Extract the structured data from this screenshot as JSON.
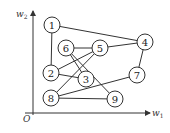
{
  "diagram": {
    "type": "graph",
    "axes": {
      "x_label": "w",
      "x_sub": "1",
      "y_label": "w",
      "y_sub": "2",
      "origin_label": "O"
    },
    "nodes": [
      {
        "id": "1",
        "label": "1",
        "x": 52,
        "y": 25
      },
      {
        "id": "2",
        "label": "2",
        "x": 51,
        "y": 73
      },
      {
        "id": "3",
        "label": "3",
        "x": 86,
        "y": 79
      },
      {
        "id": "4",
        "label": "4",
        "x": 145,
        "y": 42
      },
      {
        "id": "5",
        "label": "5",
        "x": 100,
        "y": 48
      },
      {
        "id": "6",
        "label": "6",
        "x": 66,
        "y": 48
      },
      {
        "id": "7",
        "label": "7",
        "x": 137,
        "y": 75
      },
      {
        "id": "8",
        "label": "8",
        "x": 51,
        "y": 98
      },
      {
        "id": "9",
        "label": "9",
        "x": 115,
        "y": 99
      }
    ],
    "edges": [
      [
        "1",
        "2"
      ],
      [
        "1",
        "4"
      ],
      [
        "4",
        "5"
      ],
      [
        "4",
        "7"
      ],
      [
        "6",
        "5"
      ],
      [
        "6",
        "3"
      ],
      [
        "6",
        "9"
      ],
      [
        "2",
        "5"
      ],
      [
        "2",
        "3"
      ],
      [
        "8",
        "5"
      ],
      [
        "8",
        "7"
      ],
      [
        "8",
        "9"
      ]
    ]
  }
}
